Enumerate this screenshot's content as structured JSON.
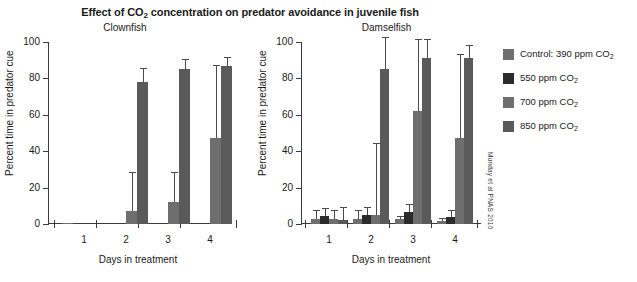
{
  "figure": {
    "title_part1": "Effect of CO",
    "title_sub": "2",
    "title_part2": " concentration on predator avoidance in juvenile fish",
    "citation": "Munday et al PNAS 2010"
  },
  "legend": {
    "position": "right",
    "items": [
      {
        "label_main": "Control: 390 ppm CO",
        "label_sub": "2",
        "color": "#6e6e6e"
      },
      {
        "label_main": "550 ppm CO",
        "label_sub": "2",
        "color": "#2b2b2b"
      },
      {
        "label_main": "700 ppm CO",
        "label_sub": "2",
        "color": "#6e6e6e"
      },
      {
        "label_main": "850 ppm CO",
        "label_sub": "2",
        "color": "#5a5a5a"
      }
    ]
  },
  "axes": {
    "ylabel": "Percent time in predator cue",
    "xlabel": "Days in treatment",
    "yticks": [
      0,
      20,
      40,
      60,
      80,
      100
    ],
    "xticks": [
      "1",
      "2",
      "3",
      "4"
    ],
    "ylim": [
      0,
      100
    ]
  },
  "chart_data": [
    {
      "type": "bar",
      "title": "Clownfish",
      "xlabel": "Days in treatment",
      "ylabel": "Percent time in predator cue",
      "ylim": [
        0,
        100
      ],
      "grid": false,
      "legend_position": "right",
      "categories": [
        "1",
        "2",
        "3",
        "4"
      ],
      "series": [
        {
          "name": "Control: 390 ppm CO2",
          "color": "#6e6e6e",
          "values": [
            0.4,
            0,
            0,
            0
          ],
          "errors": [
            0,
            0,
            0,
            0
          ]
        },
        {
          "name": "550 ppm CO2",
          "color": "#2b2b2b",
          "values": [
            0,
            0,
            0,
            0
          ],
          "errors": [
            0,
            0,
            0,
            0
          ]
        },
        {
          "name": "700 ppm CO2",
          "color": "#6e6e6e",
          "values": [
            0,
            7,
            12,
            47
          ],
          "errors": [
            0,
            21,
            16,
            40
          ]
        },
        {
          "name": "850 ppm CO2",
          "color": "#5a5a5a",
          "values": [
            0,
            78,
            85,
            87
          ],
          "errors": [
            0,
            7,
            5,
            4
          ]
        }
      ]
    },
    {
      "type": "bar",
      "title": "Damselfish",
      "xlabel": "Days in treatment",
      "ylabel": "Percent time in predator cue",
      "ylim": [
        0,
        100
      ],
      "grid": false,
      "legend_position": "right",
      "categories": [
        "1",
        "2",
        "3",
        "4"
      ],
      "series": [
        {
          "name": "Control: 390 ppm CO2",
          "color": "#6e6e6e",
          "values": [
            2.5,
            3,
            2.5,
            1.5
          ],
          "errors": [
            4.5,
            4,
            1.5,
            1.5
          ]
        },
        {
          "name": "550 ppm CO2",
          "color": "#2b2b2b",
          "values": [
            4.5,
            5,
            6.5,
            4
          ],
          "errors": [
            3.5,
            4,
            4,
            3
          ]
        },
        {
          "name": "700 ppm CO2",
          "color": "#6e6e6e",
          "values": [
            3,
            5,
            62,
            47
          ],
          "errors": [
            4,
            39,
            39,
            46
          ]
        },
        {
          "name": "850 ppm CO2",
          "color": "#5a5a5a",
          "values": [
            2,
            85,
            91,
            91
          ],
          "errors": [
            7,
            18,
            10,
            7
          ]
        }
      ]
    }
  ]
}
